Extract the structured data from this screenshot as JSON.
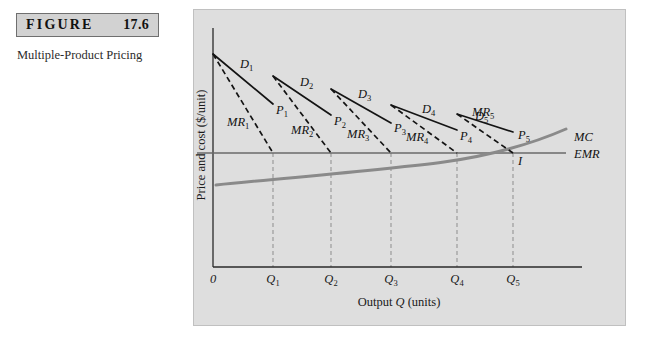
{
  "figure": {
    "badge_word": "FIGURE",
    "badge_number": "17.6",
    "caption": "Multiple-Product Pricing"
  },
  "chart_data": {
    "type": "line",
    "title": "Multiple-Product Pricing",
    "xlabel_prefix": "Output",
    "xlabel_symbol": "Q",
    "xlabel_suffix": "(units)",
    "xlabel_full": "Output Q (units)",
    "ylabel": "Price and cost ($/unit)",
    "grid": "vertical-dashed-at-quantity-ticks",
    "legend": "inline-curve-labels",
    "x_ticks": [
      "0",
      "Q1",
      "Q2",
      "Q3",
      "Q4",
      "Q5"
    ],
    "x_tick_labels": [
      {
        "base": "0",
        "sub": ""
      },
      {
        "base": "Q",
        "sub": "1"
      },
      {
        "base": "Q",
        "sub": "2"
      },
      {
        "base": "Q",
        "sub": "3"
      },
      {
        "base": "Q",
        "sub": "4"
      },
      {
        "base": "Q",
        "sub": "5"
      }
    ],
    "x_tick_positions": [
      19,
      79,
      137,
      197,
      263,
      319
    ],
    "origin_label": "0",
    "emr_level_y": 143,
    "demand_segments": [
      {
        "name": "D",
        "sub": "1",
        "x1": 19,
        "y1": 44,
        "x2": 79,
        "y2": 94,
        "label_x": 46,
        "label_y": 58,
        "price_label": "P",
        "price_sub": "1",
        "price_x": 82,
        "price_y": 104
      },
      {
        "name": "D",
        "sub": "2",
        "x1": 79,
        "y1": 66,
        "x2": 137,
        "y2": 105,
        "label_x": 106,
        "label_y": 76,
        "price_label": "P",
        "price_sub": "2",
        "price_x": 140,
        "price_y": 115
      },
      {
        "name": "D",
        "sub": "3",
        "x1": 137,
        "y1": 79,
        "x2": 197,
        "y2": 113,
        "label_x": 164,
        "label_y": 88,
        "price_label": "P",
        "price_sub": "3",
        "price_x": 200,
        "price_y": 122
      },
      {
        "name": "D",
        "sub": "4",
        "x1": 197,
        "y1": 95,
        "x2": 263,
        "y2": 120,
        "label_x": 228,
        "label_y": 103,
        "price_label": "P",
        "price_sub": "4",
        "price_x": 266,
        "price_y": 130
      },
      {
        "name": "D",
        "sub": "5",
        "x1": 263,
        "y1": 104,
        "x2": 319,
        "y2": 122,
        "label_x": 281,
        "label_y": 110,
        "price_label": "P",
        "price_sub": "5",
        "price_x": 324,
        "price_y": 129
      }
    ],
    "mr_segments": [
      {
        "name": "MR",
        "sub": "1",
        "x1": 19,
        "y1": 44,
        "x2": 79,
        "y2": 143,
        "label_x": 33,
        "label_y": 116
      },
      {
        "name": "MR",
        "sub": "2",
        "x1": 79,
        "y1": 66,
        "x2": 137,
        "y2": 143,
        "label_x": 97,
        "label_y": 124
      },
      {
        "name": "MR",
        "sub": "3",
        "x1": 137,
        "y1": 79,
        "x2": 197,
        "y2": 143,
        "label_x": 153,
        "label_y": 128
      },
      {
        "name": "MR",
        "sub": "4",
        "x1": 197,
        "y1": 95,
        "x2": 263,
        "y2": 143,
        "label_x": 212,
        "label_y": 131
      },
      {
        "name": "MR",
        "sub": "5",
        "x1": 263,
        "y1": 104,
        "x2": 319,
        "y2": 143,
        "label_x": 278,
        "label_y": 106
      }
    ],
    "mc_curve": {
      "label": "MC",
      "label_x": 380,
      "label_y": 131,
      "path": "M 22,175 C 90,168 190,160 250,152 C 300,145 340,133 372,119"
    },
    "emr_curve": {
      "label": "EMR",
      "label_x": 380,
      "label_y": 148,
      "x1": 3,
      "x2": 372
    },
    "intersection_point": {
      "label": "I",
      "x": 319,
      "y": 143,
      "label_x": 324,
      "label_y": 155
    },
    "axes": {
      "y_axis_x": 19,
      "x_axis_y": 257,
      "x_axis_end": 388,
      "y_axis_top": 18
    }
  }
}
